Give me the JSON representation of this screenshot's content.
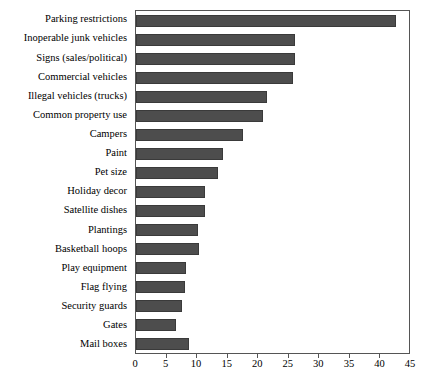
{
  "chart_data": {
    "type": "bar",
    "orientation": "horizontal",
    "title": "",
    "subtitle": "",
    "xlabel": "",
    "ylabel": "",
    "xlim": [
      0,
      45
    ],
    "ylim": null,
    "grid": false,
    "legend": null,
    "bar_color": "#4d4d4d",
    "axis_color": "#555555",
    "xticks": [
      0,
      5,
      10,
      15,
      20,
      25,
      30,
      35,
      40,
      45
    ],
    "xticklabels": [
      "0",
      "5",
      "10",
      "15",
      "20",
      "25",
      "30",
      "35",
      "40",
      "45"
    ],
    "categories": [
      "Parking restrictions",
      "Inoperable junk vehicles",
      "Signs (sales/political)",
      "Commercial vehicles",
      "Illegal vehicles (trucks)",
      "Common property use",
      "Campers",
      "Paint",
      "Pet size",
      "Holiday decor",
      "Satellite dishes",
      "Plantings",
      "Basketball hoops",
      "Play equipment",
      "Flag flying",
      "Security guards",
      "Gates",
      "Mail boxes"
    ],
    "values": [
      42.5,
      26.0,
      26.0,
      25.7,
      21.5,
      20.8,
      17.5,
      14.3,
      13.4,
      11.3,
      11.3,
      10.2,
      10.3,
      8.2,
      8.0,
      7.5,
      6.5,
      8.7
    ]
  }
}
